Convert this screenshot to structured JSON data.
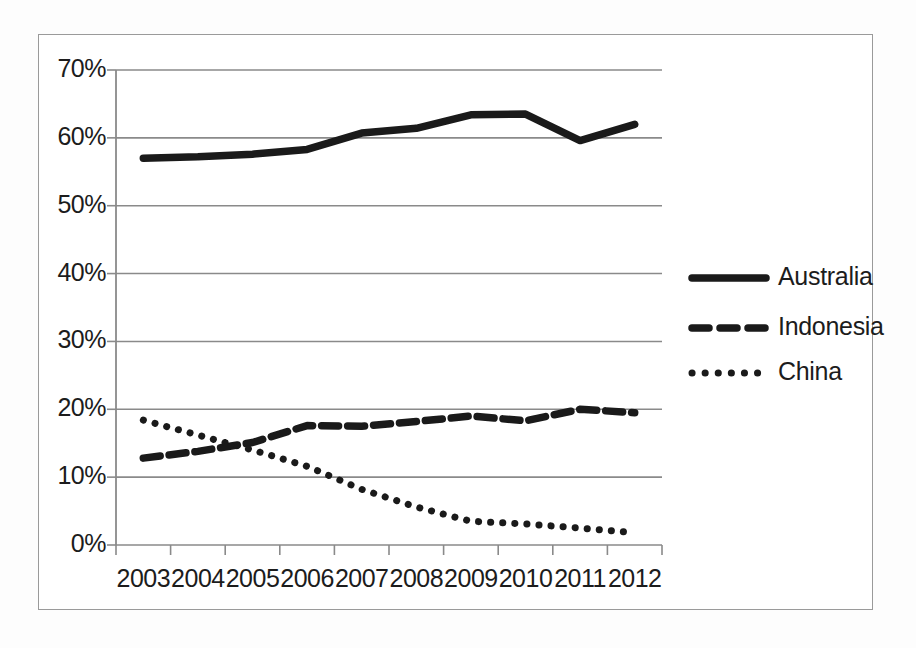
{
  "chart_data": {
    "type": "line",
    "title": "",
    "subtitle": "",
    "xlabel": "",
    "ylabel": "",
    "categories": [
      "2003",
      "2004",
      "2005",
      "2006",
      "2007",
      "2008",
      "2009",
      "2010",
      "2011",
      "2012"
    ],
    "x": [
      2003,
      2004,
      2005,
      2006,
      2007,
      2008,
      2009,
      2010,
      2011,
      2012
    ],
    "ylim": [
      0,
      70
    ],
    "ytick_labels": [
      "0%",
      "10%",
      "20%",
      "30%",
      "40%",
      "50%",
      "60%",
      "70%"
    ],
    "ytick_values": [
      0,
      10,
      20,
      30,
      40,
      50,
      60,
      70
    ],
    "xtick_labels": [
      "2003",
      "2004",
      "2005",
      "2006",
      "2007",
      "2008",
      "2009",
      "2010",
      "2011",
      "2012"
    ],
    "grid": true,
    "grid_axis": "y",
    "legend_position": "right",
    "units": "percent",
    "series": [
      {
        "name": "Australia",
        "style": "solid",
        "color": "#1a1a1a",
        "values": [
          57.0,
          57.2,
          57.6,
          58.3,
          60.7,
          61.4,
          63.4,
          63.5,
          59.6,
          62.0
        ]
      },
      {
        "name": "Indonesia",
        "style": "dashed",
        "color": "#1a1a1a",
        "values": [
          12.8,
          13.8,
          15.1,
          17.6,
          17.5,
          18.2,
          19.0,
          18.3,
          20.0,
          19.5
        ]
      },
      {
        "name": "China",
        "style": "dotted",
        "color": "#1a1a1a",
        "values": [
          18.4,
          16.2,
          14.0,
          11.6,
          8.2,
          5.6,
          3.5,
          3.1,
          2.5,
          1.8
        ]
      }
    ],
    "legend": [
      {
        "label": "Australia",
        "style": "solid"
      },
      {
        "label": "Indonesia",
        "style": "dashed"
      },
      {
        "label": "China",
        "style": "dotted"
      }
    ]
  },
  "axis": {
    "ytick_labels": [
      "70%",
      "60%",
      "50%",
      "40%",
      "30%",
      "20%",
      "10%",
      "0%"
    ],
    "xtick_labels": [
      "2003",
      "2004",
      "2005",
      "2006",
      "2007",
      "2008",
      "2009",
      "2010",
      "2011",
      "2012"
    ]
  },
  "legend": {
    "items": [
      {
        "label": "Australia"
      },
      {
        "label": "Indonesia"
      },
      {
        "label": "China"
      }
    ]
  },
  "colors": {
    "ink": "#1a1a1a",
    "grid": "#8a8a8a",
    "frame": "#9a9a9a",
    "background": "#ffffff"
  }
}
